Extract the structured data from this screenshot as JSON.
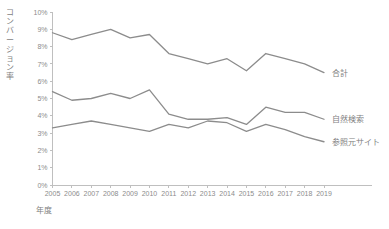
{
  "chart_data": {
    "type": "line",
    "title": "",
    "subtitle": "",
    "xlabel": "年度",
    "ylabel": "コンバージョン率",
    "categories": [
      "2005",
      "2006",
      "2007",
      "2008",
      "2009",
      "2010",
      "2011",
      "2012",
      "2013",
      "2014",
      "2015",
      "2016",
      "2017",
      "2018",
      "2019"
    ],
    "x": [
      2005,
      2006,
      2007,
      2008,
      2009,
      2010,
      2011,
      2012,
      2013,
      2014,
      2015,
      2016,
      2017,
      2018,
      2019
    ],
    "ylim": [
      0,
      10
    ],
    "xlim": [
      2005,
      2019
    ],
    "y_tick_labels": [
      "0%",
      "1%",
      "2%",
      "3%",
      "4%",
      "5%",
      "6%",
      "7%",
      "8%",
      "9%",
      "10%"
    ],
    "y_tick_values": [
      0,
      1,
      2,
      3,
      4,
      5,
      6,
      7,
      8,
      9,
      10
    ],
    "y_unit": "%",
    "grid": false,
    "legend": "inline-right",
    "series": [
      {
        "name": "合計",
        "label": "合計",
        "color": "#8c8c8c",
        "values": [
          8.8,
          8.4,
          8.7,
          9.0,
          8.5,
          8.7,
          7.6,
          7.3,
          7.0,
          7.3,
          6.6,
          7.6,
          7.3,
          7.0,
          6.5
        ]
      },
      {
        "name": "自然検索",
        "label": "自然検索",
        "color": "#8c8c8c",
        "values": [
          5.4,
          4.9,
          5.0,
          5.3,
          5.0,
          5.5,
          4.1,
          3.8,
          3.8,
          3.9,
          3.5,
          4.5,
          4.2,
          4.2,
          3.8
        ]
      },
      {
        "name": "参照元サイト",
        "label": "参照元サイト",
        "color": "#8c8c8c",
        "values": [
          3.3,
          3.5,
          3.7,
          3.5,
          3.3,
          3.1,
          3.5,
          3.3,
          3.7,
          3.6,
          3.1,
          3.5,
          3.2,
          2.8,
          2.5
        ]
      }
    ],
    "axis_color": "#bfbfbf",
    "text_color": "#7f7f7f"
  }
}
